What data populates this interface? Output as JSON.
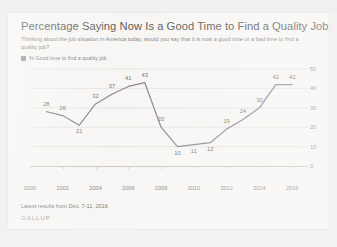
{
  "header": {
    "title": "Percentage Saying Now Is a Good Time to Find a Quality Job",
    "subtitle": "Thinking about the job situation in America today, would you say that it is now a good time or a bad time to find a quality job?"
  },
  "legend": {
    "label": "% Good time to find a quality job",
    "swatch_color": "#9b93a8"
  },
  "footer": {
    "note": "Latest results from Dec. 7-11, 2016",
    "brand": "GALLUP"
  },
  "style": {
    "line_color": "#8d8597",
    "grid_color": "#e6e4e1",
    "card_background": "#f7f6f4",
    "page_background": "#f3f2f0",
    "text_color": "#76736f"
  },
  "chart_data": {
    "type": "line",
    "title": "Percentage Saying Now Is a Good Time to Find a Quality Job",
    "xlabel": "",
    "ylabel": "",
    "ylim": [
      0,
      50
    ],
    "yticks": [
      0,
      10,
      20,
      30,
      40,
      50
    ],
    "xticks": [
      "2000",
      "2002",
      "2004",
      "2006",
      "2008",
      "2010",
      "2012",
      "2014",
      "2016"
    ],
    "grid": true,
    "legend_position": "top-left",
    "series": [
      {
        "name": "% Good time to find a quality job",
        "x": [
          2001,
          2002,
          2003,
          2004,
          2005,
          2006,
          2007,
          2008,
          2009,
          2010,
          2011,
          2012,
          2013,
          2014,
          2015,
          2016
        ],
        "values": [
          28,
          26,
          21,
          32,
          37,
          41,
          43,
          20,
          10,
          11,
          12,
          19,
          24,
          30,
          42,
          42
        ]
      }
    ]
  }
}
